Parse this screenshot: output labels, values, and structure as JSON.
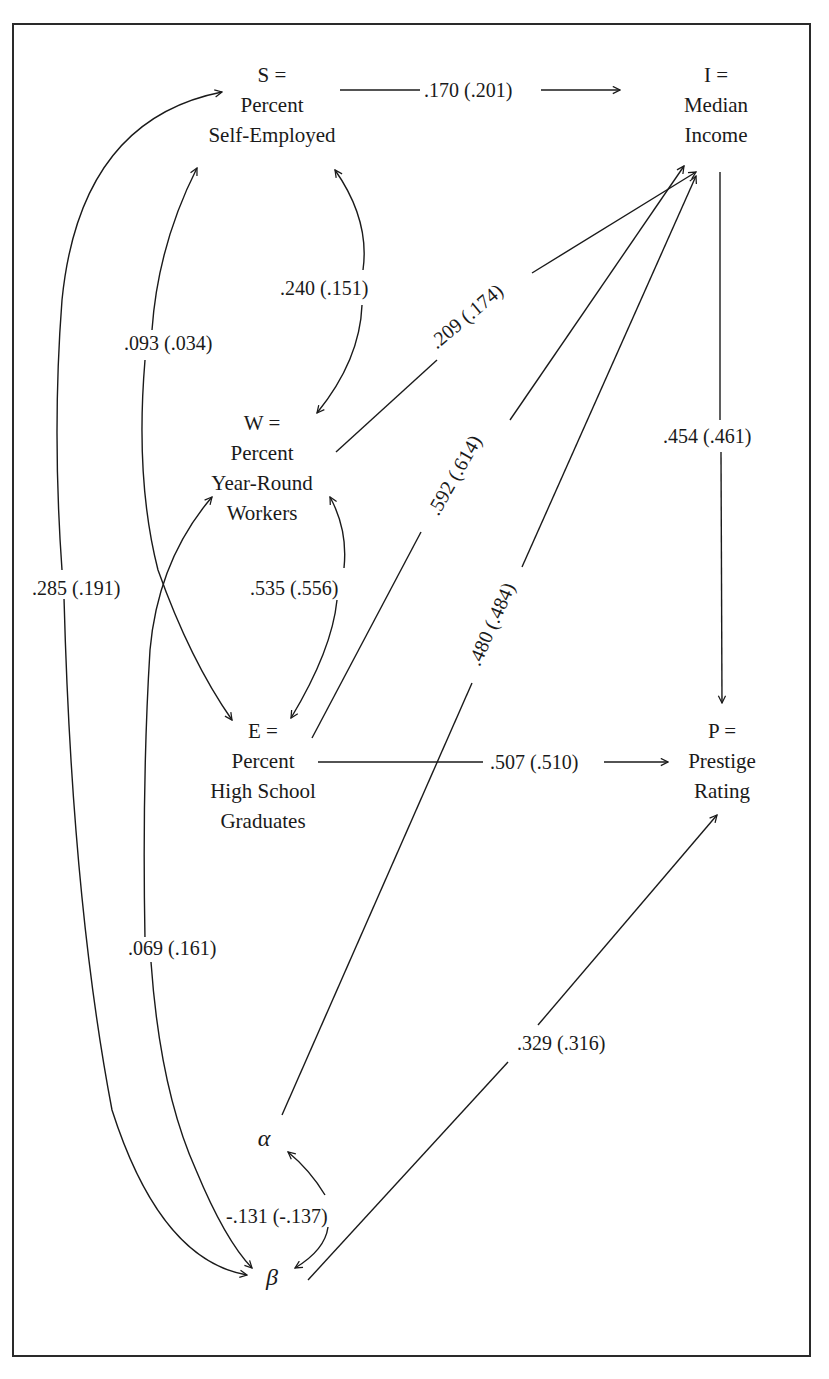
{
  "nodes": {
    "S": {
      "symbol": "S =",
      "line1": "Percent",
      "line2": "Self-Employed"
    },
    "I": {
      "symbol": "I =",
      "line1": "Median",
      "line2": "Income"
    },
    "W": {
      "symbol": "W =",
      "line1": "Percent",
      "line2": "Year-Round",
      "line3": "Workers"
    },
    "E": {
      "symbol": "E =",
      "line1": "Percent",
      "line2": "High School",
      "line3": "Graduates"
    },
    "P": {
      "symbol": "P =",
      "line1": "Prestige",
      "line2": "Rating"
    },
    "alpha": {
      "symbol": "α"
    },
    "beta": {
      "symbol": "β"
    }
  },
  "edges": [
    {
      "id": "S_I",
      "from": "S",
      "to": "I",
      "type": "directed",
      "label": ".170 (.201)"
    },
    {
      "id": "S_W",
      "from": "S",
      "to": "W",
      "type": "correlation",
      "label": ".240 (.151)"
    },
    {
      "id": "S_E",
      "from": "S",
      "to": "E",
      "type": "correlation",
      "label": ".093 (.034)"
    },
    {
      "id": "S_beta",
      "from": "S",
      "to": "beta",
      "type": "correlation",
      "label": ".285 (.191)"
    },
    {
      "id": "W_I",
      "from": "W",
      "to": "I",
      "type": "directed",
      "label": ".209 (.174)"
    },
    {
      "id": "W_E",
      "from": "W",
      "to": "E",
      "type": "correlation",
      "label": ".535 (.556)"
    },
    {
      "id": "W_beta",
      "from": "W",
      "to": "beta",
      "type": "correlation",
      "label": ".069 (.161)"
    },
    {
      "id": "E_I",
      "from": "E",
      "to": "I",
      "type": "directed",
      "label": ".592 (.614)"
    },
    {
      "id": "alpha_I",
      "from": "alpha",
      "to": "I",
      "type": "directed",
      "label": ".480 (.484)"
    },
    {
      "id": "I_P",
      "from": "I",
      "to": "P",
      "type": "directed",
      "label": ".454 (.461)"
    },
    {
      "id": "E_P",
      "from": "E",
      "to": "P",
      "type": "directed",
      "label": ".507 (.510)"
    },
    {
      "id": "beta_P",
      "from": "beta",
      "to": "P",
      "type": "directed",
      "label": ".329 (.316)"
    },
    {
      "id": "alpha_beta",
      "from": "alpha",
      "to": "beta",
      "type": "correlation",
      "label": "-.131 (-.137)"
    }
  ],
  "colors": {
    "line": "#1a1a1a",
    "background": "#ffffff",
    "frame": "#2a2a2a"
  }
}
